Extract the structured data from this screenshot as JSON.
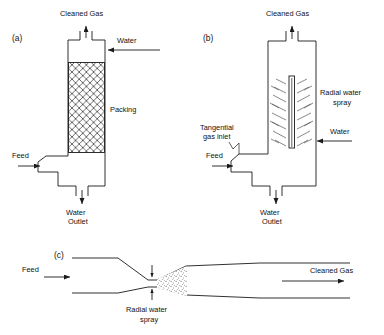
{
  "figure": {
    "type": "process-flow-diagram",
    "line_color": "#1a1a1a",
    "background_color": "#ffffff",
    "text_color": "#111111"
  },
  "panels": [
    {
      "id": "a",
      "label": "(a)",
      "name": "packed-bed-scrubber",
      "labels": {
        "cleaned_gas": "Cleaned Gas",
        "water": "Water",
        "packing": "Packing",
        "feed": "Feed",
        "water_outlet_line1": "Water",
        "water_outlet_line2": "Outlet"
      }
    },
    {
      "id": "b",
      "label": "(b)",
      "name": "spray-tower-scrubber",
      "labels": {
        "cleaned_gas": "Cleaned Gas",
        "radial_spray_line1": "Radial water",
        "radial_spray_line2": "spray",
        "tangential_line1": "Tangential",
        "tangential_line2": "gas inlet",
        "water": "Water",
        "feed": "Feed",
        "water_outlet_line1": "Water",
        "water_outlet_line2": "Outlet"
      }
    },
    {
      "id": "c",
      "label": "(c)",
      "name": "venturi-scrubber",
      "labels": {
        "feed": "Feed",
        "cleaned_gas": "Cleaned Gas",
        "radial_spray_line1": "Radial water",
        "radial_spray_line2": "spray"
      }
    }
  ]
}
